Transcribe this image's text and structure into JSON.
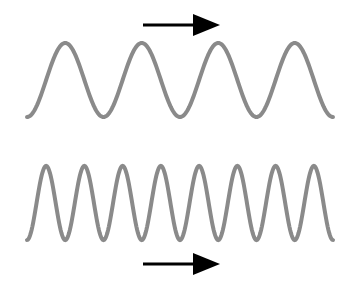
{
  "diagram": {
    "colors": {
      "background": "#ffffff",
      "wave": "#8a8a8a",
      "arrow": "#000000"
    },
    "waves": [
      {
        "id": "low-frequency-wave",
        "x_start": 27,
        "x_end": 333,
        "y_peak": 43,
        "y_trough": 117,
        "period_px": 76.5,
        "cycles": 4,
        "stroke_width": 4
      },
      {
        "id": "high-frequency-wave",
        "x_start": 27,
        "x_end": 333,
        "y_peak": 166,
        "y_trough": 240,
        "period_px": 38.25,
        "cycles": 8,
        "stroke_width": 4
      }
    ],
    "arrows": [
      {
        "id": "top-direction-arrow",
        "direction": "right",
        "x1": 143,
        "x2": 220,
        "y": 25,
        "head_width": 22
      },
      {
        "id": "bottom-direction-arrow",
        "direction": "right",
        "x1": 143,
        "x2": 220,
        "y": 264,
        "head_width": 22
      }
    ]
  }
}
